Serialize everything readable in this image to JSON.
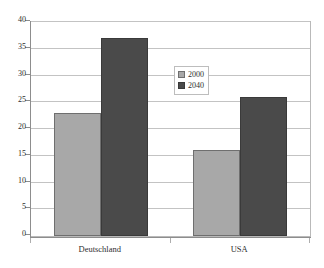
{
  "chart_data": {
    "type": "bar",
    "title": "",
    "subtitle": "",
    "xlabel": "",
    "ylabel": "",
    "categories": [
      "Deutschland",
      "USA"
    ],
    "series": [
      {
        "name": "2000",
        "values": [
          23,
          16
        ],
        "color": "#a8a8a8"
      },
      {
        "name": "2040",
        "values": [
          37,
          26
        ],
        "color": "#4a4a4a"
      }
    ],
    "ylim": [
      0,
      40
    ],
    "ytick_step": 5,
    "yticks": [
      0,
      5,
      10,
      15,
      20,
      25,
      30,
      35,
      40
    ],
    "ytick_labels": [
      "0",
      "5",
      "10",
      "15",
      "20",
      "25",
      "30",
      "35",
      "40"
    ],
    "grid": true,
    "grid_axis": "y",
    "legend_position": "top-right-inside",
    "plot_background": "#ffffff",
    "border_color": "#b9b9b9",
    "gridline_color": "#c3c3c3",
    "axis_color": "#8d8d8d"
  },
  "legend": {
    "entries": [
      {
        "label": "2000"
      },
      {
        "label": "2040"
      }
    ]
  }
}
